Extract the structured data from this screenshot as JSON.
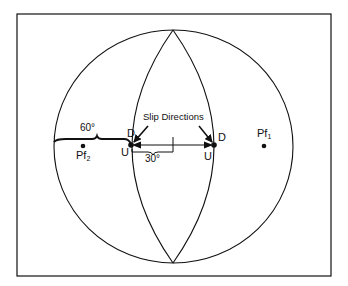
{
  "figure": {
    "frame": {
      "x": 17,
      "y": 14,
      "width": 314,
      "height": 262
    },
    "primitive_circle": {
      "cx": 173.5,
      "cy": 146.5,
      "rx": 119.5,
      "ry": 116.5
    },
    "great_circles": {
      "left_arc_midpoint_x": 132,
      "right_arc_midpoint_x": 214,
      "pole_top_y": 30,
      "pole_bottom_y": 263
    },
    "slip_points": {
      "left": {
        "x": 131,
        "y": 145
      },
      "right": {
        "x": 214,
        "y": 145
      }
    },
    "poles": {
      "pf1": {
        "x": 264,
        "y": 146
      },
      "pf2": {
        "x": 83,
        "y": 146
      }
    },
    "colors": {
      "ink": "#111111",
      "background": "#ffffff"
    }
  },
  "labels": {
    "slip_directions": "Slip Directions",
    "angle_60": "60°",
    "angle_30": "30°",
    "down_left": "D",
    "up_left": "U",
    "down_right": "D",
    "up_right": "U",
    "pole_1_base": "Pf",
    "pole_1_sub": "1",
    "pole_2_base": "Pf",
    "pole_2_sub": "2"
  }
}
